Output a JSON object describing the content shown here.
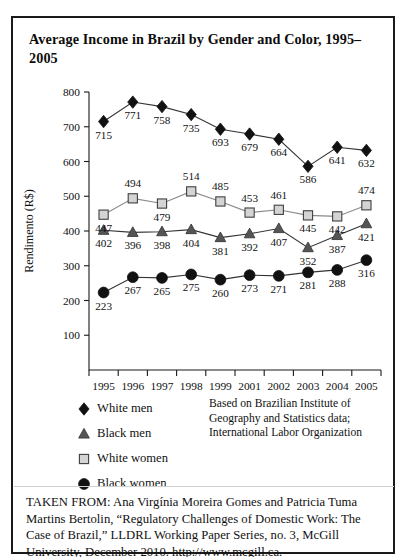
{
  "figure": {
    "title": "Average Income in Brazil by Gender and Color, 1995–2005",
    "source_note": "Based on Brazilian Institute of Geography and Statistics data; International Labor Organization",
    "caption": "TAKEN FROM: Ana Virgínia Moreira Gomes and Patricia Tuma Martins Bertolin, “Regulatory Challenges of Domestic Work: The Case of Brazil,” LLDRL Working Paper Series, no. 3, McGill University, December 2010. http://www.mcgill.ca."
  },
  "legend": {
    "items": [
      {
        "label": "White men",
        "marker": "diamond-marker",
        "color": "#111111"
      },
      {
        "label": "Black men",
        "marker": "triangle-marker",
        "color": "#555555"
      },
      {
        "label": "White women",
        "marker": "square-marker",
        "color": "#d4d4d4"
      },
      {
        "label": "Black women",
        "marker": "circle-marker",
        "color": "#111111"
      }
    ]
  },
  "chart_data": {
    "type": "line",
    "title": "Average Income in Brazil by Gender and Color, 1995–2005",
    "xlabel": "",
    "ylabel": "Rendimento (R$)",
    "categories": [
      "1995",
      "1996",
      "1997",
      "1998",
      "1999",
      "2001",
      "2002",
      "2003",
      "2004",
      "2005"
    ],
    "ylim": [
      0,
      800
    ],
    "yticks": [
      100,
      200,
      300,
      400,
      500,
      600,
      700,
      800
    ],
    "grid": false,
    "legend_position": "below-left",
    "series": [
      {
        "name": "White men",
        "marker": "diamond",
        "color": "#111111",
        "values": [
          715,
          771,
          758,
          735,
          693,
          679,
          664,
          586,
          641,
          632
        ]
      },
      {
        "name": "Black men",
        "marker": "triangle",
        "color": "#555555",
        "values": [
          402,
          396,
          398,
          404,
          381,
          392,
          407,
          352,
          387,
          421
        ]
      },
      {
        "name": "White women",
        "marker": "square",
        "color": "#d4d4d4",
        "values": [
          447,
          494,
          479,
          514,
          485,
          453,
          461,
          445,
          442,
          474
        ]
      },
      {
        "name": "Black women",
        "marker": "circle",
        "color": "#111111",
        "values": [
          223,
          267,
          265,
          275,
          260,
          273,
          271,
          281,
          288,
          316
        ]
      }
    ]
  }
}
